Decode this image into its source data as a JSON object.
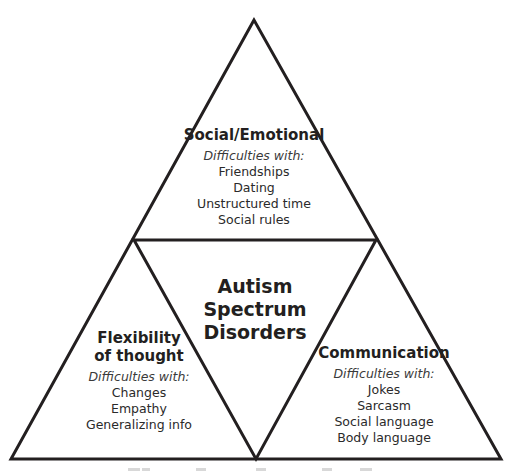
{
  "diagram": {
    "stroke_color": "#231f20",
    "background": "#ffffff",
    "center": {
      "lines": [
        "Autism",
        "Spectrum",
        "Disorders"
      ]
    },
    "top": {
      "title": "Social/Emotional",
      "subtitle": "Difficulties with:",
      "items": [
        "Friendships",
        "Dating",
        "Unstructured time",
        "Social rules"
      ]
    },
    "left": {
      "title_lines": [
        "Flexibility",
        "of thought"
      ],
      "subtitle": "Difficulties with:",
      "items": [
        "Changes",
        "Empathy",
        "Generalizing info"
      ]
    },
    "right": {
      "title": "Communication",
      "subtitle": "Difficulties with:",
      "items": [
        "Jokes",
        "Sarcasm",
        "Social language",
        "Body language"
      ]
    }
  }
}
